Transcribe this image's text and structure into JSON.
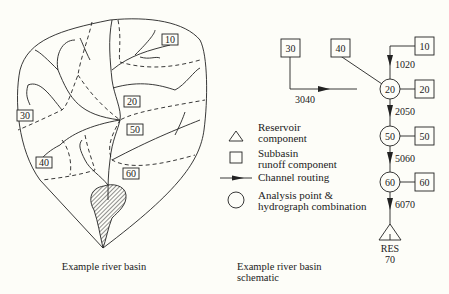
{
  "basin_map": {
    "caption": "Example river basin",
    "subbasin_labels": [
      "10",
      "20",
      "30",
      "40",
      "50",
      "60"
    ]
  },
  "schematic": {
    "caption_line1": "Example river basin",
    "caption_line2": "schematic",
    "subbasins": [
      "30",
      "40",
      "10",
      "20",
      "50",
      "60"
    ],
    "junctions": [
      "20",
      "50",
      "60"
    ],
    "reaches": [
      "1020",
      "3040",
      "2050",
      "5060",
      "6070"
    ],
    "reservoir": {
      "label": "RES",
      "id": "70"
    }
  },
  "legend": {
    "reservoir_line1": "Reservoir",
    "reservoir_line2": "component",
    "subbasin_line1": "Subbasin",
    "subbasin_line2": "runoff component",
    "routing": "Channel routing",
    "analysis_line1": "Analysis point &",
    "analysis_line2": "hydrograph combination"
  }
}
